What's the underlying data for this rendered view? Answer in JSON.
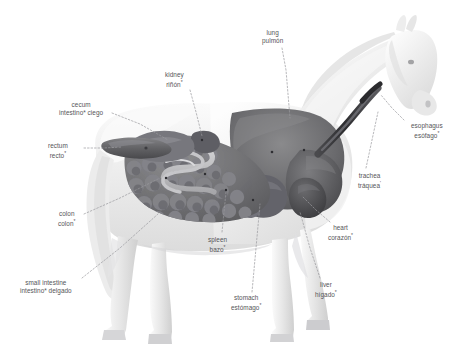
{
  "figure": {
    "orientation": "lateral view, facing right",
    "style": "grayscale airbrushed anatomical illustration",
    "background_color": "#ffffff",
    "body_color": "#f0f0f0",
    "organ_color": "#6e6e70",
    "leader_line_color": "#9a9a9e",
    "text_color": "#555558"
  },
  "labels": [
    {
      "id": "lung",
      "en": "lung",
      "es": "pulmón",
      "marker": "",
      "x": 262,
      "y": 29,
      "leader": [
        [
          282,
          48
        ],
        [
          286,
          70
        ],
        [
          290,
          118
        ]
      ]
    },
    {
      "id": "kidney",
      "en": "kidney",
      "es": "riñón",
      "marker": "*",
      "x": 165,
      "y": 71,
      "leader": [
        [
          190,
          90
        ],
        [
          196,
          112
        ],
        [
          202,
          136
        ]
      ]
    },
    {
      "id": "cecum",
      "en": "cecum",
      "es": "intestino* ciego",
      "marker": "",
      "x": 59,
      "y": 101,
      "leader": [
        [
          112,
          113
        ],
        [
          140,
          124
        ],
        [
          168,
          140
        ]
      ]
    },
    {
      "id": "esophagus",
      "en": "esophagus",
      "es": "esófago",
      "marker": "*",
      "x": 411,
      "y": 122,
      "leader": [
        [
          404,
          120
        ],
        [
          392,
          108
        ],
        [
          381,
          95
        ]
      ]
    },
    {
      "id": "rectum",
      "en": "rectum",
      "es": "recto",
      "marker": "*",
      "x": 48,
      "y": 142,
      "leader": [
        [
          84,
          148
        ],
        [
          104,
          148
        ],
        [
          122,
          147
        ]
      ]
    },
    {
      "id": "trachea",
      "en": "trachea",
      "es": "tráquea",
      "marker": "'",
      "x": 358,
      "y": 172,
      "leader": [
        [
          366,
          168
        ],
        [
          372,
          140
        ],
        [
          378,
          112
        ]
      ]
    },
    {
      "id": "colon",
      "en": "colon",
      "es": "colon",
      "marker": "*",
      "x": 58,
      "y": 210,
      "leader": [
        [
          84,
          214
        ],
        [
          120,
          198
        ],
        [
          160,
          178
        ]
      ]
    },
    {
      "id": "heart",
      "en": "heart",
      "es": "corazón",
      "marker": "*",
      "x": 328,
      "y": 224,
      "leader": [
        [
          330,
          222
        ],
        [
          316,
          210
        ],
        [
          302,
          196
        ]
      ]
    },
    {
      "id": "spleen",
      "en": "spleen",
      "es": "bazo",
      "marker": "*",
      "x": 208,
      "y": 236,
      "leader": [
        [
          222,
          232
        ],
        [
          224,
          212
        ],
        [
          226,
          192
        ]
      ]
    },
    {
      "id": "small-intestine",
      "en": "small intestine",
      "es": "intestino* delgado",
      "marker": "",
      "x": 20,
      "y": 279,
      "leader": [
        [
          82,
          278
        ],
        [
          120,
          248
        ],
        [
          158,
          214
        ]
      ]
    },
    {
      "id": "liver",
      "en": "liver",
      "es": "hígado",
      "marker": "*",
      "x": 315,
      "y": 281,
      "leader": [
        [
          320,
          278
        ],
        [
          310,
          248
        ],
        [
          300,
          212
        ]
      ]
    },
    {
      "id": "stomach",
      "en": "stomach",
      "es": "estómago",
      "marker": "*",
      "x": 231,
      "y": 294,
      "leader": [
        [
          252,
          292
        ],
        [
          256,
          248
        ],
        [
          260,
          204
        ]
      ]
    }
  ]
}
